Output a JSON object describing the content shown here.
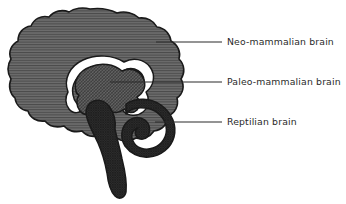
{
  "figure": {
    "name": "triune-brain-diagram",
    "background_color": "#ffffff",
    "outline_color": "#1a1a1a",
    "leader_line_color": "#2b2b2b",
    "text_color": "#2a2a2a"
  },
  "regions": {
    "neocortex": {
      "name": "Neo-mammalian brain",
      "fill_color": "#6e6e6e",
      "hatch": "horizontal-lines",
      "hatch_color": "#4a4a4a"
    },
    "limbic": {
      "name": "Paleo-mammalian brain",
      "fill_color": "#5f5f5f",
      "hatch": "diagonal-cross-hatch",
      "hatch_color": "#3d3d3d"
    },
    "brainstem": {
      "name": "Reptilian brain",
      "fill_color": "#3a3a3a",
      "hatch": "dense-cross-hatch",
      "hatch_color": "#222222"
    },
    "corpus_callosum": {
      "name": "corpus-callosum",
      "fill_color": "#ffffff"
    }
  },
  "labels": [
    {
      "id": "neo",
      "text": "Neo-mammalian brain",
      "leader": {
        "x1": 156,
        "y1": 42,
        "x2": 222,
        "y2": 42
      }
    },
    {
      "id": "paleo",
      "text": "Paleo-mammalian brain",
      "leader": {
        "x1": 110,
        "y1": 82,
        "x2": 222,
        "y2": 82
      }
    },
    {
      "id": "reptile",
      "text": "Reptilian brain",
      "leader": {
        "x1": 155,
        "y1": 122,
        "x2": 222,
        "y2": 122
      }
    }
  ]
}
